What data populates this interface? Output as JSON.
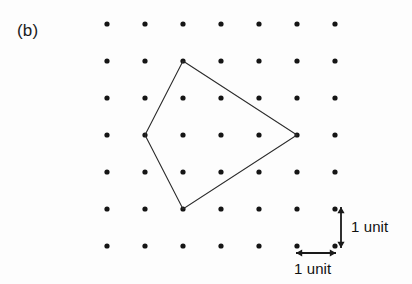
{
  "figure": {
    "panel_label": "(b)",
    "width": 412,
    "height": 284,
    "background_color": "#fdfdfd",
    "dot_color": "#151515",
    "line_color": "#2b2b2b",
    "text_color": "#1a1a1a"
  },
  "annotations": {
    "vertical_unit_label": "1 unit",
    "horizontal_unit_label": "1 unit"
  },
  "bleed_through": {
    "line1": "",
    "line2": "",
    "line3": ""
  },
  "chart_data": {
    "type": "scatter",
    "title": "(b)",
    "xlabel": "",
    "ylabel": "",
    "grid": false,
    "legend": null,
    "lattice": {
      "columns": 7,
      "rows": 7,
      "spacing_px_x": 38,
      "spacing_px_y": 37,
      "origin_px": [
        107,
        24
      ],
      "dot_radius_px": 2.6,
      "unit_value": 1,
      "unit_label": "1 unit",
      "x_grid_px": [
        107,
        145,
        183,
        221,
        259,
        297,
        335
      ],
      "y_grid_px": [
        24,
        61,
        98,
        135,
        172,
        209,
        246
      ]
    },
    "polygon": {
      "closed": true,
      "vertices_grid": [
        [
          2,
          1
        ],
        [
          5,
          3
        ],
        [
          2,
          5
        ],
        [
          1,
          3
        ]
      ],
      "vertices_px": [
        [
          183,
          61
        ],
        [
          297,
          135
        ],
        [
          183,
          209
        ],
        [
          145,
          135
        ]
      ],
      "stroke_width_px": 1.1,
      "fill": "none"
    },
    "scale_bars": [
      {
        "name": "vertical",
        "orientation": "vertical",
        "label": "1 unit",
        "from_px": [
          341,
          207
        ],
        "to_px": [
          341,
          248
        ],
        "double_headed": true
      },
      {
        "name": "horizontal",
        "orientation": "horizontal",
        "label": "1 unit",
        "from_px": [
          296,
          253
        ],
        "to_px": [
          336,
          253
        ],
        "double_headed": true
      }
    ]
  }
}
